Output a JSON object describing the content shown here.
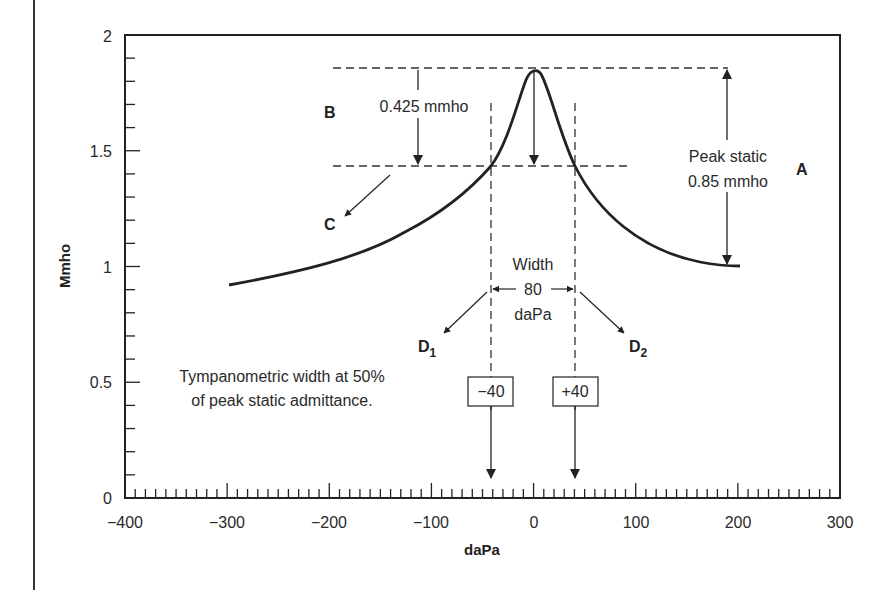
{
  "chart_data": {
    "type": "line",
    "title": "",
    "xlabel": "daPa",
    "ylabel": "Mmho",
    "xlim": [
      -400,
      300
    ],
    "ylim": [
      0,
      2
    ],
    "x_ticks": [
      "-400",
      "-300",
      "-200",
      "-100",
      "0",
      "100",
      "200",
      "300"
    ],
    "y_ticks": [
      "0",
      "0.5",
      "1",
      "1.5",
      "2"
    ],
    "x_minor_tick_step": 10,
    "y_minor_tick_step": 0.1,
    "grid": false,
    "series": [
      {
        "name": "Tympanogram",
        "x": [
          -300,
          -250,
          -200,
          -150,
          -100,
          -70,
          -40,
          -20,
          0,
          20,
          40,
          70,
          100,
          150,
          200
        ],
        "y": [
          0.92,
          0.97,
          1.03,
          1.1,
          1.2,
          1.3,
          1.425,
          1.65,
          1.85,
          1.65,
          1.425,
          1.22,
          1.1,
          1.02,
          1.0
        ]
      }
    ],
    "reference_lines": {
      "peak_level": 1.85,
      "half_peak_level": 1.425,
      "baseline_level": 1.0,
      "width_bounds": [
        -40,
        40
      ]
    },
    "annotations": {
      "A": "A",
      "B": "B",
      "C": "C",
      "D1": "D",
      "D1_sub": "1",
      "D2": "D",
      "D2_sub": "2",
      "half_drop": "0.425 mmho",
      "peak_static_line1": "Peak static",
      "peak_static_line2": "0.85 mmho",
      "width_line1": "Width",
      "width_line2": "80",
      "width_line3": "daPa",
      "box_left": "−40",
      "box_right": "+40",
      "caption_line1": "Tympanometric width at 50%",
      "caption_line2": "of peak static admittance."
    }
  },
  "axes": {
    "x_tick_labels": [
      "−400",
      "−300",
      "−200",
      "−100",
      "0",
      "100",
      "200",
      "300"
    ],
    "y_tick_labels": [
      "0",
      "0.5",
      "1",
      "1.5",
      "2"
    ]
  }
}
